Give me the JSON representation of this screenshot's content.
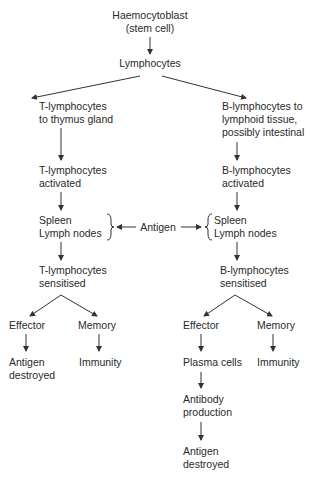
{
  "diagram": {
    "root": {
      "line1": "Haemocytoblast",
      "line2": "(stem cell)"
    },
    "lymphocytes": "Lymphocytes",
    "t_branch": {
      "to_thymus": [
        "T-lymphocytes",
        "to thymus gland"
      ],
      "activated": [
        "T-lymphocytes",
        "activated"
      ],
      "organs": [
        "Spleen",
        "Lymph nodes"
      ],
      "sensitised": [
        "T-lymphocytes",
        "sensitised"
      ],
      "effector": "Effector",
      "memory": "Memory",
      "effector_result": [
        "Antigen",
        "destroyed"
      ],
      "memory_result": "Immunity"
    },
    "b_branch": {
      "to_lymphoid": [
        "B-lymphocytes to",
        "lymphoid tissue,",
        "possibly intestinal"
      ],
      "activated": [
        "B-lymphocytes",
        "activated"
      ],
      "organs": [
        "Spleen",
        "Lymph nodes"
      ],
      "sensitised": [
        "B-lymphocytes",
        "sensitised"
      ],
      "effector": "Effector",
      "memory": "Memory",
      "plasma": "Plasma cells",
      "antibody": [
        "Antibody",
        "production"
      ],
      "effector_result": [
        "Antigen",
        "destroyed"
      ],
      "memory_result": "Immunity"
    },
    "antigen": "Antigen",
    "colors": {
      "text": "#2a2a2a",
      "lines": "#333333",
      "background": "#ffffff"
    }
  }
}
